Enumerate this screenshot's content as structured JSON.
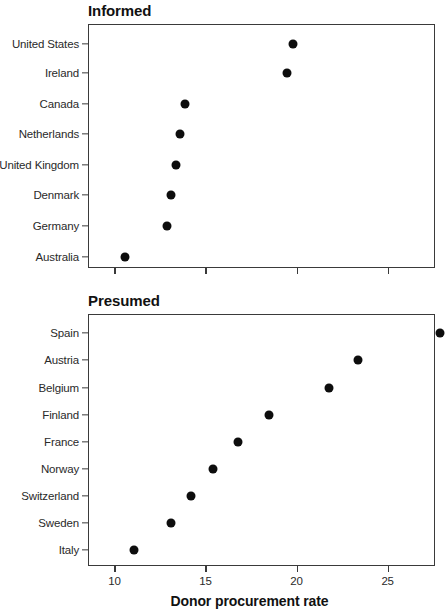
{
  "figure": {
    "width": 445,
    "height": 613,
    "background": "#ffffff",
    "point_color": "#0d0d0d",
    "axis_color": "#3a3a3a",
    "xaxis_title": "Donor procurement rate"
  },
  "panels": [
    {
      "title": "Informed",
      "title_x": 88,
      "title_y": 2,
      "box": {
        "x": 88,
        "y": 24,
        "width": 347,
        "height": 244
      },
      "x_axis": {
        "min": 8.55,
        "max": 27.6,
        "ticks": [
          10,
          15,
          20,
          25
        ],
        "tick_labels_visible": false
      },
      "categories": [
        "United States",
        "Ireland",
        "Canada",
        "Netherlands",
        "United Kingdom",
        "Denmark",
        "Germany",
        "Australia"
      ],
      "values": [
        19.8,
        19.5,
        13.9,
        13.6,
        13.4,
        13.1,
        12.9,
        10.6
      ],
      "tick_y": [
        44,
        73,
        104,
        134,
        165,
        195,
        226,
        257
      ]
    },
    {
      "title": "Presumed",
      "title_x": 88,
      "title_y": 292,
      "box": {
        "x": 88,
        "y": 314,
        "width": 347,
        "height": 252
      },
      "x_axis": {
        "min": 8.55,
        "max": 27.6,
        "ticks": [
          10,
          15,
          20,
          25
        ],
        "tick_labels_visible": true
      },
      "categories": [
        "Spain",
        "Austria",
        "Belgium",
        "Finland",
        "France",
        "Norway",
        "Switzerland",
        "Sweden",
        "Italy"
      ],
      "values": [
        27.9,
        23.4,
        21.8,
        18.5,
        16.8,
        15.4,
        14.2,
        13.1,
        11.1
      ],
      "tick_y": [
        333,
        360,
        388,
        415,
        442,
        469,
        496,
        523,
        550
      ]
    }
  ],
  "chart_data": {
    "type": "scatter",
    "title": "",
    "xlabel": "Donor procurement rate",
    "ylabel": "",
    "xlim": [
      8.55,
      27.6
    ],
    "xticks": [
      10,
      15,
      20,
      25
    ],
    "grid": false,
    "legend": "none",
    "panels": [
      {
        "panel_title": "Informed",
        "categories": [
          "United States",
          "Ireland",
          "Canada",
          "Netherlands",
          "United Kingdom",
          "Denmark",
          "Germany",
          "Australia"
        ],
        "values": [
          19.8,
          19.5,
          13.9,
          13.6,
          13.4,
          13.1,
          12.9,
          10.6
        ]
      },
      {
        "panel_title": "Presumed",
        "categories": [
          "Spain",
          "Austria",
          "Belgium",
          "Finland",
          "France",
          "Norway",
          "Switzerland",
          "Sweden",
          "Italy"
        ],
        "values": [
          27.9,
          23.4,
          21.8,
          18.5,
          16.8,
          15.4,
          14.2,
          13.1,
          11.1
        ]
      }
    ]
  }
}
